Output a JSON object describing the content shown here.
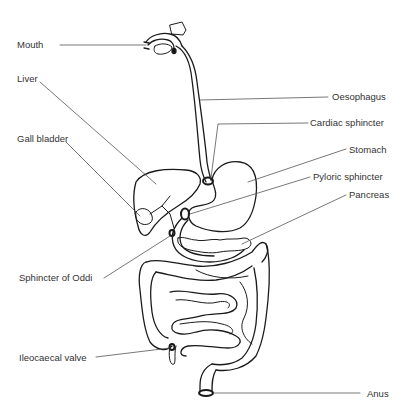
{
  "diagram": {
    "type": "anatomical-illustration",
    "labels_left": [
      {
        "id": "mouth",
        "text": "Mouth"
      },
      {
        "id": "liver",
        "text": "Liver"
      },
      {
        "id": "gall_bladder",
        "text": "Gall bladder"
      },
      {
        "id": "sphincter_oddi",
        "text": "Sphincter of Oddi"
      },
      {
        "id": "ileocaecal_valve",
        "text": "Ileocaecal valve"
      }
    ],
    "labels_right": [
      {
        "id": "oesophagus",
        "text": "Oesophagus"
      },
      {
        "id": "cardiac_sphincter",
        "text": "Cardiac sphincter"
      },
      {
        "id": "stomach",
        "text": "Stomach"
      },
      {
        "id": "pyloric_sphincter",
        "text": "Pyloric sphincter"
      },
      {
        "id": "pancreas",
        "text": "Pancreas"
      },
      {
        "id": "anus",
        "text": "Anus"
      }
    ]
  },
  "colors": {
    "stroke": "#1a1a1a",
    "leader": "#555555",
    "text": "#333333",
    "background": "#ffffff"
  }
}
